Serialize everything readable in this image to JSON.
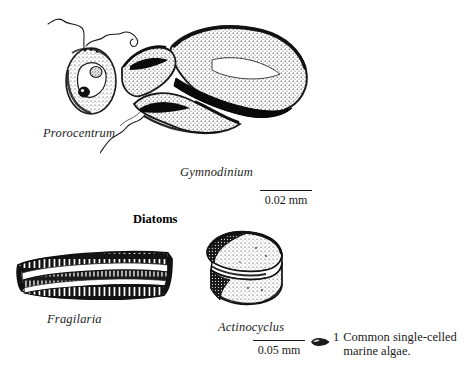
{
  "page": {
    "background": "#ffffff",
    "ink": "#1a1a1a",
    "width": 475,
    "height": 383
  },
  "organisms": [
    {
      "id": "prorocentrum",
      "label": "Prorocentrum",
      "group": "dinoflagellate",
      "icon": "prorocentrum-cell-icon"
    },
    {
      "id": "gymnodinium",
      "label": "Gymnodinium",
      "group": "dinoflagellate",
      "icon": "gymnodinium-cell-icon"
    },
    {
      "id": "fragilaria",
      "label": "Fragilaria",
      "group": "diatom",
      "icon": "fragilaria-frustule-icon"
    },
    {
      "id": "actinocyclus",
      "label": "Actinocyclus",
      "group": "diatom",
      "icon": "actinocyclus-frustule-icon"
    }
  ],
  "headings": {
    "diatoms": "Diatoms"
  },
  "scale_bars": [
    {
      "id": "scale-upper",
      "text": "0.02 mm",
      "length_px": 52
    },
    {
      "id": "scale-lower",
      "text": "0.05 mm",
      "length_px": 52
    }
  ],
  "caption": {
    "marker": "algae-cell-marker-icon",
    "number": "1",
    "line1": "Common single-celled",
    "line2": "marine algae."
  }
}
